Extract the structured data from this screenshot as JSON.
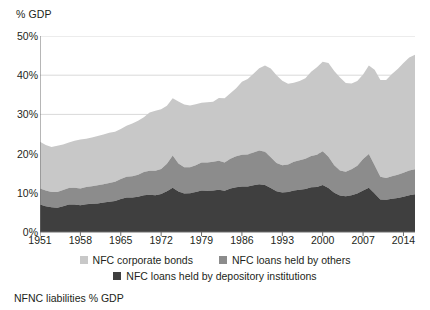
{
  "chart_data": {
    "type": "area",
    "stacked": true,
    "title": "",
    "subtitle": "",
    "caption": "NFNC liabilities % GDP",
    "ylabel": "% GDP",
    "xlabel": "",
    "ylim": [
      0,
      50
    ],
    "xlim": [
      1951,
      2016
    ],
    "grid": true,
    "grid_axis": "y",
    "legend_position": "bottom",
    "ytick_labels": [
      "50%",
      "40%",
      "30%",
      "20%",
      "10%",
      "0%"
    ],
    "ytick_values": [
      50,
      40,
      30,
      20,
      10,
      0
    ],
    "xtick_labels": [
      "1951",
      "1958",
      "1965",
      "1972",
      "1979",
      "1986",
      "1993",
      "2000",
      "2007",
      "2014"
    ],
    "xtick_values": [
      1951,
      1958,
      1965,
      1972,
      1979,
      1986,
      1993,
      2000,
      2007,
      2014
    ],
    "x": [
      1951,
      1952,
      1953,
      1954,
      1955,
      1956,
      1957,
      1958,
      1959,
      1960,
      1961,
      1962,
      1963,
      1964,
      1965,
      1966,
      1967,
      1968,
      1969,
      1970,
      1971,
      1972,
      1973,
      1974,
      1975,
      1976,
      1977,
      1978,
      1979,
      1980,
      1981,
      1982,
      1983,
      1984,
      1985,
      1986,
      1987,
      1988,
      1989,
      1990,
      1991,
      1992,
      1993,
      1994,
      1995,
      1996,
      1997,
      1998,
      1999,
      2000,
      2001,
      2002,
      2003,
      2004,
      2005,
      2006,
      2007,
      2008,
      2009,
      2010,
      2011,
      2012,
      2013,
      2014,
      2015,
      2016
    ],
    "series": [
      {
        "name": "NFC loans held by depository institutions",
        "color": "#3f3f3f",
        "stack_order": 1,
        "values": [
          7.0,
          6.6,
          6.3,
          6.2,
          6.6,
          7.0,
          7.0,
          6.8,
          7.1,
          7.2,
          7.3,
          7.5,
          7.7,
          7.9,
          8.4,
          8.8,
          8.8,
          9.0,
          9.4,
          9.5,
          9.4,
          9.7,
          10.4,
          11.3,
          10.3,
          9.8,
          9.9,
          10.2,
          10.6,
          10.5,
          10.6,
          10.8,
          10.5,
          11.1,
          11.4,
          11.6,
          11.6,
          11.9,
          12.2,
          12.0,
          11.2,
          10.4,
          10.1,
          10.2,
          10.6,
          10.8,
          11.0,
          11.4,
          11.5,
          12.0,
          11.2,
          10.0,
          9.3,
          9.1,
          9.4,
          9.8,
          10.6,
          11.3,
          9.8,
          8.3,
          8.2,
          8.5,
          8.7,
          9.0,
          9.4,
          9.6
        ]
      },
      {
        "name": "NFC loans held by others",
        "color": "#8c8c8c",
        "stack_order": 2,
        "values": [
          4.1,
          4.0,
          3.9,
          4.0,
          4.1,
          4.2,
          4.3,
          4.3,
          4.4,
          4.5,
          4.6,
          4.7,
          4.8,
          4.9,
          5.1,
          5.3,
          5.4,
          5.6,
          5.9,
          6.1,
          6.2,
          6.4,
          7.0,
          8.2,
          7.2,
          6.7,
          6.6,
          6.8,
          7.1,
          7.2,
          7.3,
          7.4,
          7.2,
          7.6,
          7.9,
          8.1,
          8.2,
          8.4,
          8.6,
          8.5,
          7.9,
          7.2,
          6.9,
          7.0,
          7.3,
          7.5,
          7.7,
          8.0,
          8.2,
          8.6,
          8.0,
          7.0,
          6.4,
          6.3,
          6.6,
          7.1,
          8.0,
          8.6,
          7.2,
          5.8,
          5.6,
          5.7,
          5.9,
          6.1,
          6.3,
          6.4
        ]
      },
      {
        "name": "NFC corporate bonds",
        "color": "#c8c8c8",
        "stack_order": 3,
        "values": [
          11.9,
          11.6,
          11.5,
          11.8,
          11.6,
          11.6,
          12.0,
          12.5,
          12.3,
          12.4,
          12.6,
          12.7,
          12.8,
          12.8,
          12.8,
          13.0,
          13.5,
          13.8,
          14.0,
          14.9,
          15.3,
          15.2,
          14.8,
          14.6,
          15.8,
          16.0,
          15.8,
          15.6,
          15.3,
          15.4,
          15.3,
          16.0,
          16.4,
          16.7,
          17.4,
          18.6,
          19.2,
          20.1,
          21.0,
          22.0,
          22.6,
          22.4,
          21.6,
          20.6,
          20.2,
          20.2,
          20.5,
          21.5,
          22.3,
          22.8,
          23.9,
          24.1,
          23.7,
          22.6,
          21.9,
          21.6,
          21.6,
          22.6,
          24.4,
          24.7,
          25.0,
          26.1,
          27.0,
          28.0,
          28.8,
          29.2
        ]
      }
    ],
    "total_values": [
      23.0,
      22.2,
      21.7,
      22.0,
      22.3,
      22.8,
      23.3,
      23.6,
      23.8,
      24.1,
      24.5,
      24.9,
      25.3,
      25.6,
      26.3,
      27.1,
      27.7,
      28.4,
      29.3,
      30.5,
      30.9,
      31.3,
      32.2,
      34.1,
      33.3,
      32.5,
      32.3,
      32.6,
      33.0,
      33.1,
      33.2,
      34.2,
      34.1,
      35.4,
      36.7,
      38.3,
      39.0,
      40.4,
      41.8,
      42.5,
      41.7,
      40.0,
      38.6,
      37.8,
      38.1,
      38.5,
      39.2,
      40.9,
      42.0,
      43.4,
      43.1,
      41.1,
      39.4,
      38.0,
      37.9,
      38.5,
      40.2,
      42.5,
      41.4,
      38.8,
      38.8,
      40.3,
      41.6,
      43.1,
      44.5,
      45.2
    ]
  },
  "legend": {
    "items": [
      {
        "label": "NFC corporate bonds",
        "color": "#c8c8c8"
      },
      {
        "label": "NFC loans held by others",
        "color": "#8c8c8c"
      },
      {
        "label": "NFC loans held by depository institutions",
        "color": "#3f3f3f"
      }
    ]
  },
  "colors": {
    "grid": "#d9d9d9",
    "axis": "#6f6f6f",
    "text": "#231f20",
    "background": "#ffffff"
  }
}
